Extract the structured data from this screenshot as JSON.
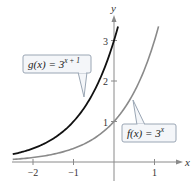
{
  "chart_data": {
    "type": "line",
    "title": "",
    "xlabel": "x",
    "ylabel": "y",
    "xlim": [
      -2.5,
      1.2
    ],
    "ylim": [
      0,
      3.4
    ],
    "x_ticks": [
      -2,
      -1,
      1
    ],
    "x_tick_labels": [
      "−2",
      "−1",
      "1"
    ],
    "y_ticks": [
      1,
      2,
      3
    ],
    "y_tick_labels": [
      "1",
      "2",
      "3"
    ],
    "grid": false,
    "series": [
      {
        "name": "g(x) = 3^(x+1)",
        "label_base": "g(x) = 3",
        "label_exp": "x + 1",
        "color": "#111111",
        "x": [
          -2.5,
          -2,
          -1.5,
          -1,
          -0.5,
          0,
          0.1
        ],
        "values": [
          0.192,
          0.333,
          0.577,
          1,
          1.732,
          3,
          3.348
        ]
      },
      {
        "name": "f(x) = 3^x",
        "label_base": "f(x) = 3",
        "label_exp": "x",
        "color": "#8a8a8a",
        "x": [
          -2.5,
          -2,
          -1,
          0,
          0.5,
          1,
          1.1
        ],
        "values": [
          0.064,
          0.111,
          0.333,
          1,
          1.732,
          3,
          3.348
        ]
      }
    ]
  }
}
